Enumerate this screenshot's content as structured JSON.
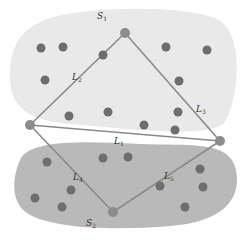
{
  "diagram": {
    "colors": {
      "background": "#ffffff",
      "region_s1": "#e9e9e9",
      "region_s2": "#b9b9b9",
      "dot": "#6e6e6e",
      "vertex": "#8c8c8c",
      "edge": "#8a8a8a"
    },
    "regions": [
      {
        "id": "S1",
        "label": "S",
        "sub": "1"
      },
      {
        "id": "S2",
        "label": "S",
        "sub": "2"
      }
    ],
    "vertices": {
      "top": [
        125,
        33
      ],
      "left": [
        30,
        125
      ],
      "right": [
        220,
        141
      ],
      "bottom": [
        113,
        212
      ]
    },
    "edges": [
      {
        "id": "L1",
        "label": "L",
        "sub": "1",
        "from": "left",
        "to": "right"
      },
      {
        "id": "L2",
        "label": "L",
        "sub": "2",
        "from": "left",
        "to": "top"
      },
      {
        "id": "L3",
        "label": "L",
        "sub": "3",
        "from": "top",
        "to": "right"
      },
      {
        "id": "L4",
        "label": "L",
        "sub": "4",
        "from": "left",
        "to": "bottom"
      },
      {
        "id": "L5",
        "label": "L",
        "sub": "5",
        "from": "bottom",
        "to": "right"
      }
    ],
    "s1_points": [
      [
        41,
        48
      ],
      [
        63,
        47
      ],
      [
        103,
        55
      ],
      [
        166,
        47
      ],
      [
        207,
        50
      ],
      [
        45,
        80
      ],
      [
        179,
        81
      ],
      [
        69,
        116
      ],
      [
        108,
        112
      ],
      [
        178,
        112
      ],
      [
        144,
        125
      ],
      [
        175,
        130
      ]
    ],
    "s2_points": [
      [
        47,
        162
      ],
      [
        103,
        158
      ],
      [
        128,
        157
      ],
      [
        200,
        169
      ],
      [
        71,
        190
      ],
      [
        203,
        187
      ],
      [
        35,
        198
      ],
      [
        62,
        207
      ],
      [
        160,
        186
      ],
      [
        185,
        207
      ]
    ]
  }
}
